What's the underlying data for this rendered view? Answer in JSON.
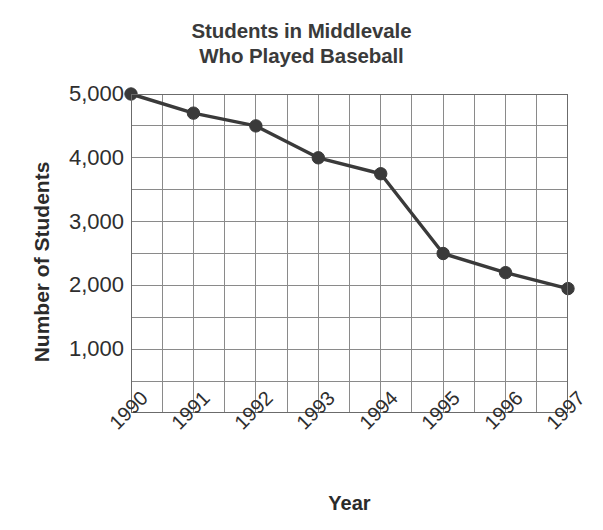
{
  "chart_data": {
    "type": "line",
    "title": "Students in Middlevale\nWho Played Baseball",
    "title_line1": "Students in Middlevale",
    "title_line2": "Who Played Baseball",
    "xlabel": "Year",
    "ylabel": "Number of Students",
    "categories": [
      "1990",
      "1991",
      "1992",
      "1993",
      "1994",
      "1995",
      "1996",
      "1997"
    ],
    "values": [
      5000,
      4700,
      4500,
      4000,
      3750,
      2500,
      2200,
      1950
    ],
    "x": [
      1990,
      1991,
      1992,
      1993,
      1994,
      1995,
      1996,
      1997
    ],
    "ylim": [
      0,
      5000
    ],
    "ytick_values": [
      1000,
      2000,
      3000,
      4000,
      5000
    ],
    "ytick_labels": [
      "1,000",
      "2,000",
      "3,000",
      "4,000",
      "5,000"
    ],
    "y_minor_step": 500,
    "x_minor_step": 0.5,
    "grid": true,
    "grid_color": "#8a8a8a",
    "legend": "none",
    "series_color": "#3a3a3a",
    "marker": "circle",
    "points": [
      {
        "year": "1990",
        "value": 5000
      },
      {
        "year": "1991",
        "value": 4700
      },
      {
        "year": "1992",
        "value": 4500
      },
      {
        "year": "1993",
        "value": 4000
      },
      {
        "year": "1994",
        "value": 3750
      },
      {
        "year": "1995",
        "value": 2500
      },
      {
        "year": "1996",
        "value": 2200
      },
      {
        "year": "1997",
        "value": 1950
      }
    ]
  }
}
